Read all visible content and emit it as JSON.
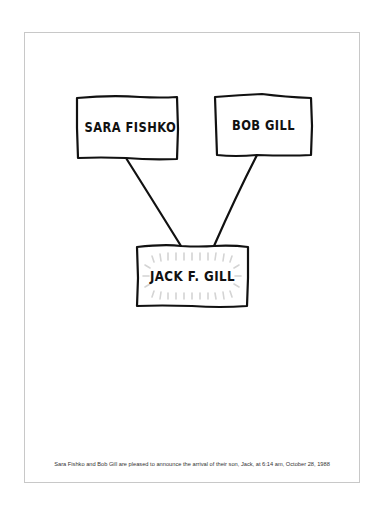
{
  "card": {
    "boxes": [
      {
        "id": "sara",
        "label": "SARA FISHKO"
      },
      {
        "id": "bob",
        "label": "BOB GILL"
      },
      {
        "id": "jack",
        "label": "JACK F. GILL"
      }
    ],
    "caption": "Sara Fishko and Bob Gill are pleased to announce the arrival of their son, Jack, at 6:14 am, October 28, 1988"
  },
  "colors": {
    "ink": "#111111",
    "border": "#c8c8c8",
    "glow": "#d8d8d8"
  }
}
